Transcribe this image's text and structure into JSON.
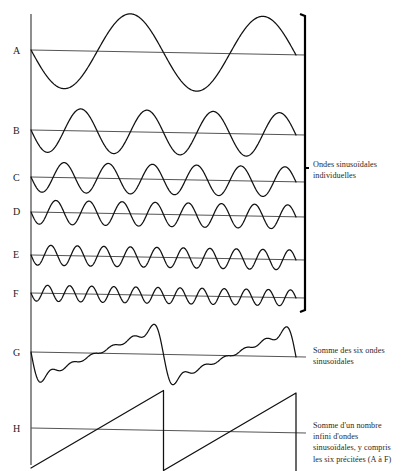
{
  "figure": {
    "background_color": "#ffffff",
    "curve_color": "#111111",
    "baseline_color": "#555555",
    "axis_color": "#444444",
    "bracket_color": "#000000",
    "plot": {
      "x_start": 31,
      "x_end": 296,
      "axis_top": 14,
      "axis_bottom": 465
    },
    "wave_labels": [
      {
        "id": "A",
        "text": "A",
        "x": 13,
        "y": 45
      },
      {
        "id": "B",
        "text": "B",
        "x": 13,
        "y": 125
      },
      {
        "id": "C",
        "text": "C",
        "x": 13,
        "y": 172
      },
      {
        "id": "D",
        "text": "D",
        "x": 13,
        "y": 206
      },
      {
        "id": "E",
        "text": "E",
        "x": 13,
        "y": 249
      },
      {
        "id": "F",
        "text": "F",
        "x": 13,
        "y": 288
      },
      {
        "id": "G",
        "text": "G",
        "x": 13,
        "y": 347
      },
      {
        "id": "H",
        "text": "H",
        "x": 13,
        "y": 423
      }
    ],
    "annotations": [
      {
        "id": "individual-sine-waves",
        "lines": [
          "Ondes sinusoïdales",
          "individuelles"
        ],
        "x": 313,
        "y": 159
      },
      {
        "id": "sum-of-six-sine-waves",
        "lines": [
          "Somme des six ondes",
          "sinusoïdales"
        ],
        "x": 313,
        "y": 345
      },
      {
        "id": "sum-of-infinite-sine-waves",
        "lines": [
          "Somme d'un nombre",
          "infini d'ondes",
          "sinusoïdales, y compris",
          "les six précitées (A à F)"
        ],
        "x": 313,
        "y": 420
      }
    ],
    "bracket": {
      "id": "individual-waves-bracket",
      "x": 305,
      "y_top": 14,
      "y_bottom": 312,
      "tick_y": 168
    }
  },
  "chart_data": {
    "type": "line",
    "xlabel": "",
    "ylabel": "",
    "grid": false,
    "legend": "none",
    "x_domain": [
      0,
      2
    ],
    "x_unit": "périodes de l'onde fondamentale",
    "series": [
      {
        "name": "A",
        "label": "A",
        "kind": "sine",
        "harmonic": 1,
        "cycles": 2,
        "amplitude": 38,
        "phase": "negative-sine",
        "baseline_y": 50,
        "description": "Onde sinusoïdale fondamentale, 2 périodes affichées"
      },
      {
        "name": "B",
        "label": "B",
        "kind": "sine",
        "harmonic": 2,
        "cycles": 4,
        "amplitude": 22,
        "phase": "negative-sine",
        "baseline_y": 130,
        "description": "Deuxième harmonique, amplitude 1/2"
      },
      {
        "name": "C",
        "label": "C",
        "kind": "sine",
        "harmonic": 3,
        "cycles": 6,
        "amplitude": 15,
        "phase": "negative-sine",
        "baseline_y": 177,
        "description": "Troisième harmonique, amplitude 1/3"
      },
      {
        "name": "D",
        "label": "D",
        "kind": "sine",
        "harmonic": 4,
        "cycles": 8,
        "amplitude": 12,
        "phase": "negative-sine",
        "baseline_y": 212,
        "description": "Quatrième harmonique, amplitude 1/4"
      },
      {
        "name": "E",
        "label": "E",
        "kind": "sine",
        "harmonic": 5,
        "cycles": 10,
        "amplitude": 10,
        "phase": "negative-sine",
        "baseline_y": 255,
        "description": "Cinquième harmonique, amplitude 1/5"
      },
      {
        "name": "F",
        "label": "F",
        "kind": "sine",
        "harmonic": 6,
        "cycles": 12,
        "amplitude": 8,
        "phase": "negative-sine",
        "baseline_y": 293,
        "description": "Sixième harmonique, amplitude 1/6"
      },
      {
        "name": "G",
        "label": "G",
        "kind": "partial-sum",
        "harmonics_included": 6,
        "cycles": 2,
        "amplitude": 30,
        "baseline_y": 352,
        "description": "Somme des six ondes sinusoïdales A à F"
      },
      {
        "name": "H",
        "label": "H",
        "kind": "sawtooth",
        "harmonics_included": "infini",
        "cycles": 2,
        "amplitude": 40,
        "baseline_y": 428,
        "description": "Onde en dents de scie, somme d'un nombre infini d'ondes sinusoïdales"
      }
    ]
  }
}
